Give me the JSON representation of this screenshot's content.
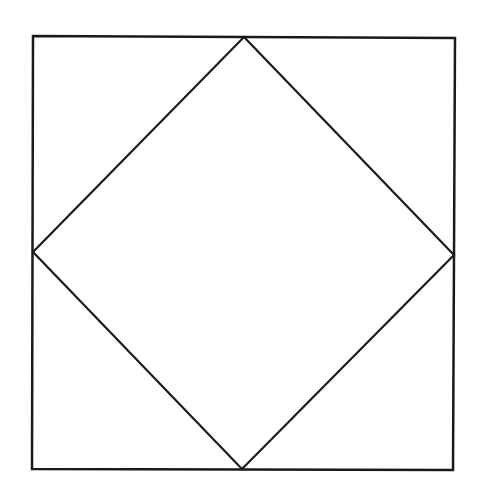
{
  "diagram": {
    "background": "#ffffff",
    "stroke_color": "#1a1a1a",
    "stroke_width": 2.5,
    "outer_square": {
      "points": [
        [
          33,
          36
        ],
        [
          455,
          38
        ],
        [
          453,
          470
        ],
        [
          32,
          469
        ]
      ]
    },
    "inner_diamond": {
      "points": [
        [
          244,
          37
        ],
        [
          454,
          255
        ],
        [
          242,
          469
        ],
        [
          33,
          252
        ]
      ]
    }
  }
}
